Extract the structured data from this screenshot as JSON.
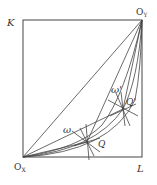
{
  "diagram": {
    "type": "edgeworth-box",
    "labels": {
      "origin_x": "O",
      "origin_x_sub": "X",
      "origin_y": "O",
      "origin_y_sub": "Y",
      "top_left_axis": "K",
      "bottom_right_axis": "L",
      "point_q": "Q",
      "point_q_prime": "Q'",
      "omega": "ω",
      "omega_prime": "ω'"
    },
    "colors": {
      "line": "#333333",
      "background": "#ffffff"
    }
  }
}
